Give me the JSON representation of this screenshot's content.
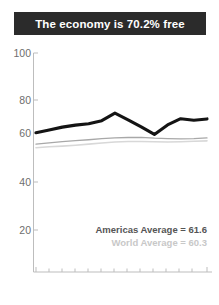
{
  "title": {
    "text": "The economy is 70.2% free",
    "background_color": "#2b2b2b",
    "text_color": "#ffffff"
  },
  "legend": {
    "americas_label": "Americas Average = 61.6",
    "world_label": "World Average = 60.3",
    "americas_color": "#555555",
    "world_color": "#c8c8c8"
  },
  "axes": {
    "y_ticks": [
      "100",
      "80",
      "60",
      "40",
      "20"
    ],
    "x_start_label": "1995",
    "x_end_label": "2008"
  },
  "chart_data": {
    "type": "line",
    "title": "The economy is 70.2% free",
    "xlabel": "",
    "ylabel": "",
    "ylim": [
      0,
      100
    ],
    "xlim": [
      1995,
      2008
    ],
    "yticks": [
      20,
      40,
      60,
      80,
      100
    ],
    "grid": false,
    "legend_position": "inside-bottom-right",
    "x": [
      1995,
      1996,
      1997,
      1998,
      1999,
      2000,
      2001,
      2002,
      2003,
      2004,
      2005,
      2006,
      2007,
      2008
    ],
    "series": [
      {
        "name": "Economic freedom score",
        "color": "#1a1a1a",
        "values": [
          64.0,
          65.2,
          66.5,
          67.4,
          68.0,
          69.4,
          72.8,
          69.8,
          66.6,
          63.2,
          67.5,
          70.3,
          69.6,
          70.2
        ]
      },
      {
        "name": "Americas Average",
        "color": "#8c8c8c",
        "annotation": "Americas Average = 61.6",
        "values": [
          58.8,
          59.4,
          59.9,
          60.4,
          60.8,
          61.3,
          61.6,
          61.8,
          61.9,
          61.5,
          61.3,
          61.2,
          61.3,
          61.6
        ]
      },
      {
        "name": "World Average",
        "color": "#d2d2d2",
        "annotation": "World Average = 60.3",
        "values": [
          57.2,
          57.6,
          57.9,
          58.3,
          58.8,
          59.3,
          59.8,
          60.0,
          60.0,
          59.9,
          59.8,
          59.9,
          60.1,
          60.3
        ]
      }
    ]
  }
}
